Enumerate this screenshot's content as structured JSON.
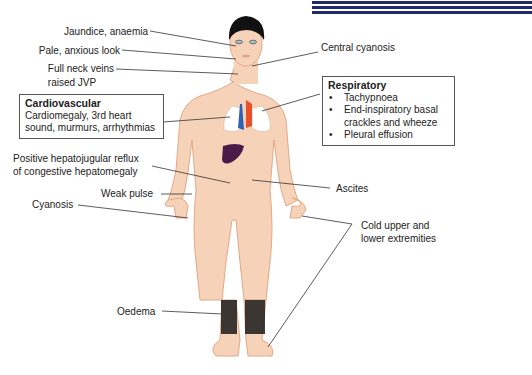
{
  "figure": {
    "type": "annotated-body-diagram",
    "colors": {
      "skin": "#f6d2b8",
      "skin_outline": "#e2a987",
      "hair": "#111111",
      "lungs": "#ffffff",
      "vein_blue": "#2f62b4",
      "artery_red": "#e8502a",
      "liver": "#4a1a48",
      "oedema": "#1b1b1b",
      "header_stripes": "#1f2a6b",
      "leader_lines": "#333333"
    }
  },
  "labels": {
    "jaundice": "Jaundice, anaemia",
    "pale": "Pale, anxious look",
    "neck_veins_1": "Full neck veins",
    "neck_veins_2": "raised JVP",
    "central_cyanosis": "Central cyanosis",
    "hepatojugular_1": "Positive hepatojugular reflux",
    "hepatojugular_2": "of congestive hepatomegaly",
    "weak_pulse": "Weak pulse",
    "cyanosis": "Cyanosis",
    "ascites": "Ascites",
    "cold_1": "Cold upper  and",
    "cold_2": "lower extremities",
    "oedema": "Oedema"
  },
  "cardiovascular_box": {
    "title": "Cardiovascular",
    "line1": "Cardiomegaly, 3rd heart",
    "line2": "sound, murmurs, arrhythmias"
  },
  "respiratory_box": {
    "title": "Respiratory",
    "items": [
      "Tachypnoea",
      "End-inspiratory basal",
      "crackles and wheeze",
      "Pleural effusion"
    ]
  }
}
